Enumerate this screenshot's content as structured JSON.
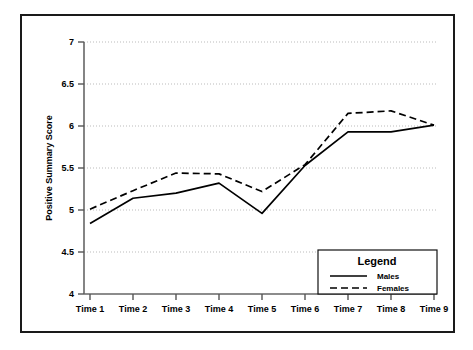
{
  "chart_data": {
    "type": "line",
    "title": "",
    "xlabel": "",
    "ylabel": "Positive Summary Score",
    "categories": [
      "Time 1",
      "Time 2",
      "Time 3",
      "Time 4",
      "Time 5",
      "Time 6",
      "Time 7",
      "Time 8",
      "Time 9"
    ],
    "series": [
      {
        "name": "Males",
        "style": "solid",
        "color": "#000000",
        "values": [
          4.84,
          5.14,
          5.2,
          5.32,
          4.96,
          5.53,
          5.93,
          5.93,
          6.01
        ]
      },
      {
        "name": "Females",
        "style": "dashed",
        "color": "#000000",
        "values": [
          5.01,
          5.23,
          5.44,
          5.43,
          5.22,
          5.54,
          6.15,
          6.18,
          6.01
        ]
      }
    ],
    "ylim": [
      4,
      7
    ],
    "yticks": [
      4,
      4.5,
      5,
      5.5,
      6,
      6.5,
      7
    ],
    "ytick_labels": [
      "4",
      "4.5",
      "5",
      "5.5",
      "6",
      "6.5",
      "7"
    ],
    "grid": true,
    "grid_style": "dotted-horizontal",
    "legend": {
      "title": "Legend",
      "position": "bottom-right",
      "entries": [
        {
          "label": "Males",
          "style": "solid"
        },
        {
          "label": "Females",
          "style": "dashed"
        }
      ]
    }
  },
  "colors": {
    "frame": "#1a1a1a",
    "axis": "#555555",
    "grid": "#bbbbbb",
    "line": "#000000",
    "background": "#ffffff"
  }
}
